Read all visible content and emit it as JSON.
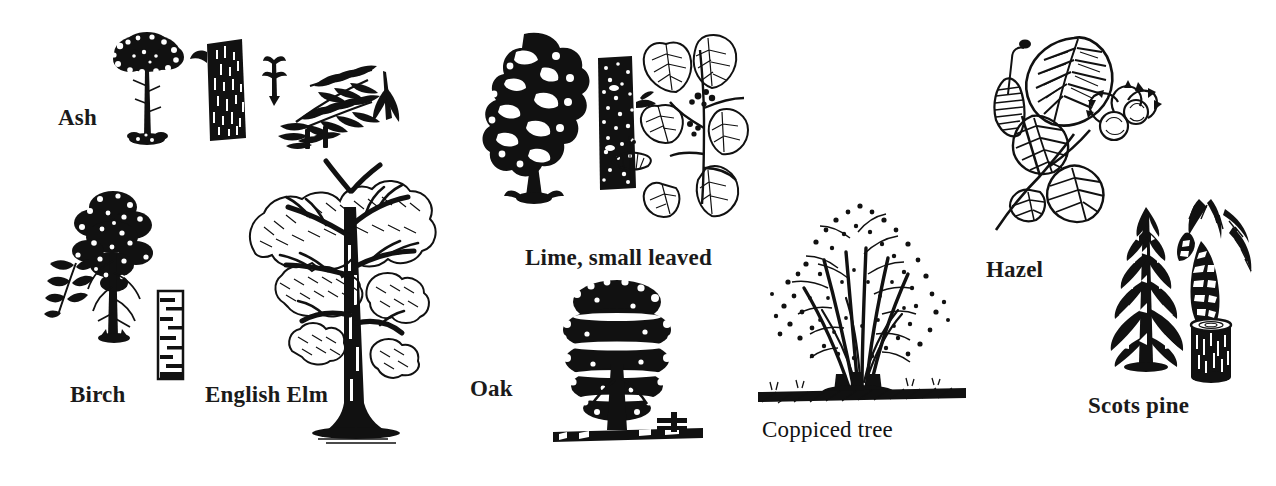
{
  "plate": {
    "title": "Tree identification illustrations",
    "background_color": "#ffffff",
    "ink_color": "#111111",
    "width": 1276,
    "height": 486,
    "style": "black and white line / scratchboard engraving"
  },
  "species": [
    {
      "id": "ash",
      "label": "Ash",
      "label_weight": "bold",
      "label_x": 58,
      "label_y": 106,
      "parts": [
        "tree-silhouette",
        "bark-trunk",
        "compound-leaf",
        "bud-sprig",
        "winged-seed"
      ],
      "figure_x": 100,
      "figure_y": 26,
      "figure_w": 300,
      "figure_h": 125
    },
    {
      "id": "birch",
      "label": "Birch",
      "label_weight": "bold",
      "label_x": 70,
      "label_y": 383,
      "parts": [
        "tree-silhouette",
        "leaf-sprig",
        "white-bark-trunk"
      ],
      "figure_x": 50,
      "figure_y": 165,
      "figure_w": 135,
      "figure_h": 215
    },
    {
      "id": "english-elm",
      "label": "English Elm",
      "label_weight": "bold",
      "label_x": 205,
      "label_y": 383,
      "parts": [
        "tree-silhouette"
      ],
      "figure_x": 240,
      "figure_y": 155,
      "figure_w": 215,
      "figure_h": 295
    },
    {
      "id": "lime-small-leaved",
      "label": "Lime, small leaved",
      "label_weight": "bold",
      "label_x": 525,
      "label_y": 246,
      "parts": [
        "tree-silhouette",
        "bark-trunk",
        "heart-leaf-spray",
        "flower-bract"
      ],
      "figure_x": 480,
      "figure_y": 28,
      "figure_w": 285,
      "figure_h": 190
    },
    {
      "id": "oak",
      "label": "Oak",
      "label_weight": "bold",
      "label_x": 470,
      "label_y": 377,
      "parts": [
        "tree-silhouette",
        "ground-line"
      ],
      "figure_x": 553,
      "figure_y": 272,
      "figure_w": 150,
      "figure_h": 180
    },
    {
      "id": "coppiced-tree",
      "label": "Coppiced tree",
      "label_weight": "regular",
      "label_x": 762,
      "label_y": 418,
      "parts": [
        "multi-stem-stool",
        "ground-line"
      ],
      "figure_x": 758,
      "figure_y": 178,
      "figure_w": 205,
      "figure_h": 225
    },
    {
      "id": "hazel",
      "label": "Hazel",
      "label_weight": "bold",
      "label_x": 986,
      "label_y": 258,
      "parts": [
        "broad-veined-leaves",
        "catkin",
        "nuts-in-husk"
      ],
      "figure_x": 980,
      "figure_y": 32,
      "figure_w": 180,
      "figure_h": 200
    },
    {
      "id": "scots-pine",
      "label": "Scots pine",
      "label_weight": "bold",
      "label_x": 1088,
      "label_y": 394,
      "parts": [
        "conifer-silhouette",
        "cone-and-needles",
        "log-section"
      ],
      "figure_x": 1095,
      "figure_y": 195,
      "figure_w": 175,
      "figure_h": 185
    }
  ]
}
